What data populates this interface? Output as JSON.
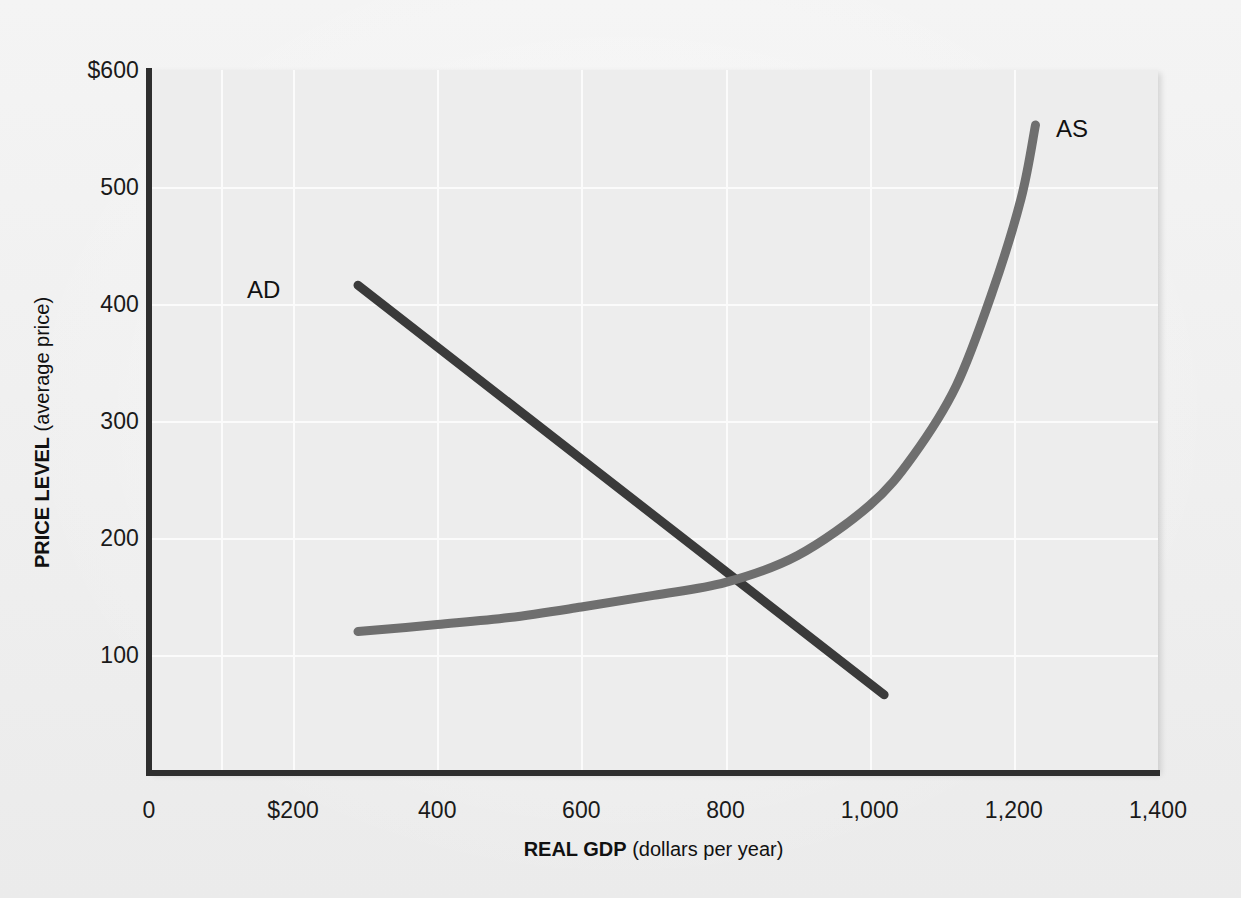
{
  "figure": {
    "background_color": "#f1f1f1",
    "plot_background_color": "#ededed",
    "gridline_color": "#fbfbfb",
    "axis_color": "#2e2e2e"
  },
  "chart_data": {
    "type": "line",
    "title": "",
    "xlabel_bold": "REAL GDP",
    "xlabel_rest": " (dollars per year)",
    "ylabel_bold": "PRICE LEVEL",
    "ylabel_rest": " (average price)",
    "xlim": [
      0,
      1400
    ],
    "ylim": [
      0,
      600
    ],
    "grid": true,
    "legend_position": "inline-curve-labels",
    "x_ticks": [
      {
        "value": 0,
        "label": "0"
      },
      {
        "value": 200,
        "label": "$200"
      },
      {
        "value": 400,
        "label": "400"
      },
      {
        "value": 600,
        "label": "600"
      },
      {
        "value": 800,
        "label": "800"
      },
      {
        "value": 1000,
        "label": "1,000"
      },
      {
        "value": 1200,
        "label": "1,200"
      },
      {
        "value": 1400,
        "label": "1,400"
      }
    ],
    "y_ticks": [
      {
        "value": 600,
        "label": "$600"
      },
      {
        "value": 500,
        "label": "500"
      },
      {
        "value": 400,
        "label": "400"
      },
      {
        "value": 300,
        "label": "300"
      },
      {
        "value": 200,
        "label": "200"
      },
      {
        "value": 100,
        "label": "100"
      }
    ],
    "gridlines_x": [
      100,
      200,
      400,
      600,
      800,
      1000,
      1200
    ],
    "gridlines_y": [
      500,
      400,
      300,
      200,
      100
    ],
    "series": [
      {
        "name": "AD",
        "label": "AD",
        "color": "#3a3a3a",
        "line_width": 9,
        "description": "Aggregate demand: downward sloping straight line",
        "points": [
          {
            "x": 290,
            "y": 416
          },
          {
            "x": 1020,
            "y": 66
          }
        ]
      },
      {
        "name": "AS",
        "label": "AS",
        "color": "#6f6f6f",
        "line_width": 9,
        "description": "Aggregate supply: flat at low output, rising then near-vertical at capacity",
        "points": [
          {
            "x": 290,
            "y": 120
          },
          {
            "x": 400,
            "y": 126
          },
          {
            "x": 500,
            "y": 132
          },
          {
            "x": 600,
            "y": 141
          },
          {
            "x": 700,
            "y": 151
          },
          {
            "x": 800,
            "y": 162
          },
          {
            "x": 900,
            "y": 185
          },
          {
            "x": 1000,
            "y": 228
          },
          {
            "x": 1060,
            "y": 270
          },
          {
            "x": 1120,
            "y": 330
          },
          {
            "x": 1170,
            "y": 410
          },
          {
            "x": 1210,
            "y": 490
          },
          {
            "x": 1230,
            "y": 553
          }
        ]
      }
    ],
    "equilibrium": {
      "x": 800,
      "y": 160,
      "marked": false
    },
    "annotations": [
      {
        "text": "AD",
        "x": 215,
        "y": 430
      },
      {
        "text": "AS",
        "x": 1270,
        "y": 580
      }
    ]
  }
}
